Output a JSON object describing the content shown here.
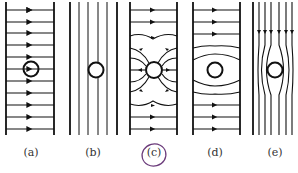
{
  "figure": {
    "panels": [
      {
        "id": "a",
        "label": "(a)",
        "description": "uniform horizontal field lines with arrows, circle at center"
      },
      {
        "id": "b",
        "label": "(b)",
        "description": "vertical lines, circle placed among them"
      },
      {
        "id": "c",
        "label": "(c)",
        "description": "field lines converge radially into circle",
        "circled": true
      },
      {
        "id": "d",
        "label": "(d)",
        "description": "horizontal field lines bend around circle"
      },
      {
        "id": "e",
        "label": "(e)",
        "description": "vertical field lines with downward arrows bend around circle"
      }
    ]
  },
  "colors": {
    "line": "#111111",
    "annotation": "#6a3a7a",
    "label": "#333333"
  }
}
